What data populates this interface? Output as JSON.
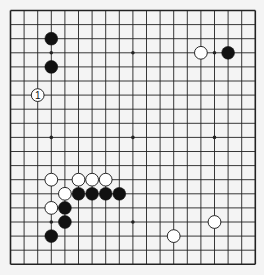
{
  "board": {
    "size": 19,
    "origin_x": 10.5,
    "origin_y": 10.5,
    "spacing_x": 13.6,
    "spacing_y": 14.1,
    "line_color": "#222222",
    "background": "#f4f4f4",
    "hoshi": [
      [
        3,
        3
      ],
      [
        9,
        3
      ],
      [
        15,
        3
      ],
      [
        3,
        9
      ],
      [
        9,
        9
      ],
      [
        15,
        9
      ],
      [
        3,
        15
      ],
      [
        9,
        15
      ],
      [
        15,
        15
      ]
    ]
  },
  "stones": [
    {
      "color": "black",
      "col": 3,
      "row": 2
    },
    {
      "color": "black",
      "col": 3,
      "row": 4
    },
    {
      "color": "white",
      "col": 2,
      "row": 6,
      "label": "1"
    },
    {
      "color": "white",
      "col": 14,
      "row": 3
    },
    {
      "color": "black",
      "col": 16,
      "row": 3
    },
    {
      "color": "white",
      "col": 3,
      "row": 12
    },
    {
      "color": "white",
      "col": 5,
      "row": 12
    },
    {
      "color": "white",
      "col": 6,
      "row": 12
    },
    {
      "color": "white",
      "col": 7,
      "row": 12
    },
    {
      "color": "white",
      "col": 4,
      "row": 13
    },
    {
      "color": "black",
      "col": 5,
      "row": 13
    },
    {
      "color": "black",
      "col": 6,
      "row": 13
    },
    {
      "color": "black",
      "col": 7,
      "row": 13
    },
    {
      "color": "black",
      "col": 8,
      "row": 13
    },
    {
      "color": "white",
      "col": 3,
      "row": 14
    },
    {
      "color": "black",
      "col": 4,
      "row": 14
    },
    {
      "color": "black",
      "col": 4,
      "row": 15
    },
    {
      "color": "black",
      "col": 3,
      "row": 16
    },
    {
      "color": "white",
      "col": 15,
      "row": 15
    },
    {
      "color": "white",
      "col": 12,
      "row": 16
    }
  ]
}
